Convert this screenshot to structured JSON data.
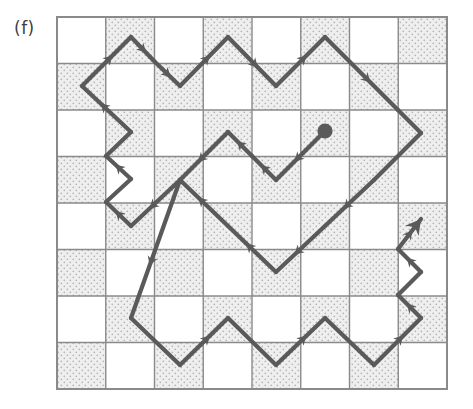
{
  "figure": {
    "panel_label": "(f)",
    "caption_label": "(f)",
    "kind": "lattice-walk-on-checkerboard",
    "colors": {
      "background": "#ffffff",
      "grid_line": "#8a8a8a",
      "shaded_cell_fill": "#eeeeee",
      "shaded_cell_dot": "#b9b9b9",
      "light_cell_fill": "#ffffff",
      "path_stroke": "#5a5a5a",
      "marker": "#5a5a5a",
      "label_text": "#3f3f3f"
    },
    "grid": {
      "columns": 8,
      "rows": 8,
      "origin_x": 57,
      "origin_y": 17,
      "cell_width": 48.75,
      "cell_height": 46.5,
      "border_width": 2,
      "line_width": 1.4,
      "pattern": "checkerboard",
      "shaded_parity": 1,
      "shading_style": "stippled",
      "shaded_cells": [
        [
          1,
          0
        ],
        [
          3,
          0
        ],
        [
          5,
          0
        ],
        [
          7,
          0
        ],
        [
          0,
          1
        ],
        [
          2,
          1
        ],
        [
          4,
          1
        ],
        [
          6,
          1
        ],
        [
          1,
          2
        ],
        [
          3,
          2
        ],
        [
          5,
          2
        ],
        [
          7,
          2
        ],
        [
          0,
          3
        ],
        [
          2,
          3
        ],
        [
          4,
          3
        ],
        [
          6,
          3
        ],
        [
          1,
          4
        ],
        [
          3,
          4
        ],
        [
          5,
          4
        ],
        [
          7,
          4
        ],
        [
          0,
          5
        ],
        [
          2,
          5
        ],
        [
          4,
          5
        ],
        [
          6,
          5
        ],
        [
          1,
          6
        ],
        [
          3,
          6
        ],
        [
          5,
          6
        ],
        [
          7,
          6
        ],
        [
          0,
          7
        ],
        [
          2,
          7
        ],
        [
          4,
          7
        ],
        [
          6,
          7
        ]
      ]
    },
    "path": {
      "stroke_width": 4.2,
      "description": "closed 45-degree diagonal walk on edge midpoints",
      "start_marker": "filled-circle",
      "end_marker": "filled-triangle-arrowhead",
      "start_point": [
        325,
        131
      ],
      "end_point": [
        421,
        219
      ],
      "arrow_count": 22,
      "vertices_px": [
        [
          325,
          131
        ],
        [
          300,
          156
        ],
        [
          276,
          132
        ],
        [
          252,
          156
        ],
        [
          228,
          132
        ],
        [
          204,
          155
        ],
        [
          180,
          132
        ],
        [
          155,
          109
        ],
        [
          131,
          37
        ],
        [
          155,
          37
        ],
        [
          131,
          37
        ],
        [
          106,
          62
        ],
        [
          82,
          86
        ],
        [
          106,
          109
        ],
        [
          131,
          133
        ],
        [
          107,
          156
        ],
        [
          82,
          179
        ],
        [
          106,
          202
        ],
        [
          131,
          226
        ],
        [
          107,
          249
        ],
        [
          82,
          272
        ],
        [
          106,
          295
        ],
        [
          131,
          318
        ],
        [
          155,
          342
        ],
        [
          131,
          365
        ],
        [
          180,
          365
        ],
        [
          204,
          342
        ],
        [
          228,
          365
        ],
        [
          252,
          342
        ],
        [
          277,
          365
        ],
        [
          301,
          342
        ],
        [
          325,
          365
        ],
        [
          350,
          342
        ],
        [
          374,
          365
        ],
        [
          398,
          342
        ],
        [
          374,
          318
        ],
        [
          398,
          295
        ],
        [
          374,
          272
        ],
        [
          398,
          249
        ],
        [
          421,
          226
        ],
        [
          421,
          219
        ]
      ],
      "segments": [
        {
          "from": [
            325,
            131
          ],
          "to": [
            276,
            180
          ],
          "direction": "down-left",
          "arrow": true
        },
        {
          "from": [
            276,
            180
          ],
          "to": [
            252,
            156
          ],
          "direction": "up-left",
          "arrow": true
        },
        {
          "from": [
            252,
            156
          ],
          "to": [
            228,
            132
          ],
          "direction": "up-left",
          "arrow": true
        },
        {
          "from": [
            228,
            132
          ],
          "to": [
            180,
            180
          ],
          "direction": "down-left",
          "arrow": true
        },
        {
          "from": [
            180,
            180
          ],
          "to": [
            131,
            226
          ],
          "direction": "down-left",
          "arrow": true
        },
        {
          "from": [
            131,
            226
          ],
          "to": [
            106,
            202
          ],
          "direction": "up-left",
          "arrow": true
        },
        {
          "from": [
            106,
            202
          ],
          "to": [
            131,
            179
          ],
          "direction": "up-right",
          "arrow": false
        },
        {
          "from": [
            131,
            179
          ],
          "to": [
            106,
            156
          ],
          "direction": "up-left",
          "arrow": true
        },
        {
          "from": [
            106,
            156
          ],
          "to": [
            131,
            132
          ],
          "direction": "up-right",
          "arrow": false
        },
        {
          "from": [
            131,
            132
          ],
          "to": [
            82,
            86
          ],
          "direction": "up-left",
          "arrow": true
        },
        {
          "from": [
            82,
            86
          ],
          "to": [
            131,
            37
          ],
          "direction": "up-right",
          "arrow": true
        },
        {
          "from": [
            131,
            37
          ],
          "to": [
            155,
            62
          ],
          "direction": "down-right",
          "arrow": true
        },
        {
          "from": [
            155,
            62
          ],
          "to": [
            180,
            86
          ],
          "direction": "down-right",
          "arrow": true
        },
        {
          "from": [
            180,
            86
          ],
          "to": [
            228,
            37
          ],
          "direction": "up-right",
          "arrow": true
        },
        {
          "from": [
            228,
            37
          ],
          "to": [
            276,
            86
          ],
          "direction": "down-right",
          "arrow": true
        },
        {
          "from": [
            276,
            86
          ],
          "to": [
            325,
            37
          ],
          "direction": "up-right",
          "arrow": true
        },
        {
          "from": [
            325,
            37
          ],
          "to": [
            398,
            110
          ],
          "direction": "down-right",
          "arrow": true
        },
        {
          "from": [
            398,
            110
          ],
          "to": [
            421,
            133
          ],
          "direction": "down-right",
          "arrow": false
        },
        {
          "from": [
            421,
            133
          ],
          "to": [
            374,
            180
          ],
          "direction": "down-left",
          "arrow": false
        },
        {
          "from": [
            374,
            180
          ],
          "to": [
            325,
            226
          ],
          "direction": "down-left",
          "arrow": true
        },
        {
          "from": [
            325,
            226
          ],
          "to": [
            276,
            272
          ],
          "direction": "down-left",
          "arrow": true
        },
        {
          "from": [
            276,
            272
          ],
          "to": [
            228,
            226
          ],
          "direction": "up-left",
          "arrow": true
        },
        {
          "from": [
            228,
            226
          ],
          "to": [
            180,
            180
          ],
          "direction": "up-left",
          "arrow": true
        },
        {
          "from": [
            180,
            180
          ],
          "to": [
            131,
            318
          ],
          "direction": "down-left",
          "arrow": true
        },
        {
          "from": [
            131,
            318
          ],
          "to": [
            180,
            365
          ],
          "direction": "down-right",
          "arrow": false
        },
        {
          "from": [
            180,
            365
          ],
          "to": [
            228,
            318
          ],
          "direction": "up-right",
          "arrow": true
        },
        {
          "from": [
            228,
            318
          ],
          "to": [
            276,
            365
          ],
          "direction": "down-right",
          "arrow": false
        },
        {
          "from": [
            276,
            365
          ],
          "to": [
            325,
            318
          ],
          "direction": "up-right",
          "arrow": true
        },
        {
          "from": [
            325,
            318
          ],
          "to": [
            374,
            365
          ],
          "direction": "down-right",
          "arrow": false
        },
        {
          "from": [
            374,
            365
          ],
          "to": [
            421,
            318
          ],
          "direction": "up-right",
          "arrow": true
        },
        {
          "from": [
            421,
            318
          ],
          "to": [
            398,
            295
          ],
          "direction": "up-left",
          "arrow": true
        },
        {
          "from": [
            398,
            295
          ],
          "to": [
            421,
            272
          ],
          "direction": "up-right",
          "arrow": false
        },
        {
          "from": [
            421,
            272
          ],
          "to": [
            398,
            249
          ],
          "direction": "up-left",
          "arrow": true
        },
        {
          "from": [
            398,
            249
          ],
          "to": [
            421,
            219
          ],
          "direction": "up-right",
          "arrow": true
        }
      ]
    }
  }
}
